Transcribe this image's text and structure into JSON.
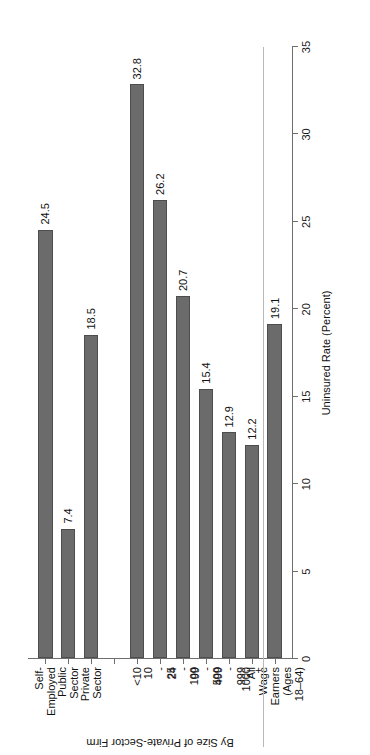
{
  "chart_data": {
    "type": "bar",
    "orientation": "horizontal",
    "title": "",
    "subtitle": "",
    "xlabel": "Uninsured Rate (Percent)",
    "ylabel": "By Size of Private-Sector Firm",
    "value_axis_label": "Uninsured Rate (Percent)",
    "category_axis_label": "By Size of Private-Sector Firm",
    "xlim": [
      0,
      35
    ],
    "ylim": [
      0,
      35
    ],
    "ticks": [
      0,
      5,
      10,
      15,
      20,
      25,
      30,
      35
    ],
    "tick_labels": [
      "0",
      "5",
      "10",
      "15",
      "20",
      "25",
      "30",
      "35"
    ],
    "grid": false,
    "legend": false,
    "legend_position": "none",
    "categories": [
      "Self-\nEmployed",
      "Public\nSector",
      "Private\nSector",
      "",
      "<10",
      "10 - 24",
      "25 - 99",
      "100 - 499",
      "500 - 999",
      "1000 +",
      "All Wage\nEarners\n(Ages 18–64)"
    ],
    "values": [
      24.5,
      7.4,
      18.5,
      null,
      32.8,
      26.2,
      20.7,
      15.4,
      12.9,
      12.2,
      19.1
    ],
    "value_labels": [
      "24.5",
      "7.4",
      "18.5",
      "",
      "32.8",
      "26.2",
      "20.7",
      "15.4",
      "12.9",
      "12.2",
      "19.1"
    ],
    "bars": [
      {
        "category": "Self-\nEmployed",
        "value": 24.5,
        "label": "24.5"
      },
      {
        "category": "Public\nSector",
        "value": 7.4,
        "label": "7.4"
      },
      {
        "category": "Private\nSector",
        "value": 18.5,
        "label": "18.5"
      },
      {
        "category": "",
        "value": null,
        "label": ""
      },
      {
        "category": "<10",
        "value": 32.8,
        "label": "32.8"
      },
      {
        "category": "10 - 24",
        "value": 26.2,
        "label": "26.2"
      },
      {
        "category": "25 - 99",
        "value": 20.7,
        "label": "20.7"
      },
      {
        "category": "100 - 499",
        "value": 15.4,
        "label": "15.4"
      },
      {
        "category": "500 - 999",
        "value": 12.9,
        "label": "12.9"
      },
      {
        "category": "1000 +",
        "value": 12.2,
        "label": "12.2"
      },
      {
        "category": "All Wage\nEarners\n(Ages 18–64)",
        "value": 19.1,
        "label": "19.1"
      }
    ],
    "separator_after_index": 9,
    "colors": {
      "bar_fill": "#6b6b6b",
      "bar_border": "#4d4d4d",
      "axis": "#6e6e6e",
      "separator": "#b9b9b9",
      "text": "#111111",
      "background": "#ffffff"
    }
  }
}
